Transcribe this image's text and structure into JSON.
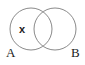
{
  "diagram": {
    "type": "venn",
    "sets": [
      {
        "label": "A",
        "cx": 31,
        "cy": 29,
        "r": 21
      },
      {
        "label": "B",
        "cx": 55,
        "cy": 29,
        "r": 21
      }
    ],
    "marker": {
      "text": "x",
      "region": "A only"
    },
    "stroke_color": "#8a8a8a"
  }
}
